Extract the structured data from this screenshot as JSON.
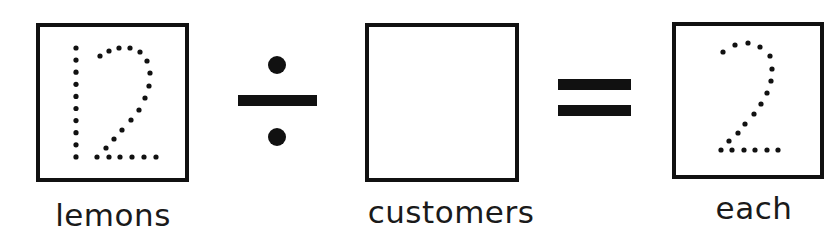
{
  "equation": {
    "dividend": {
      "value": "12",
      "style": "dotted-tracing",
      "label": "lemons"
    },
    "operator_1": {
      "symbol": "÷",
      "name": "divide"
    },
    "divisor": {
      "value": "",
      "style": "empty-box",
      "label": "customers"
    },
    "operator_2": {
      "symbol": "=",
      "name": "equals"
    },
    "quotient": {
      "value": "2",
      "style": "dotted-tracing",
      "label": "each"
    }
  },
  "colors": {
    "ink": "#111111",
    "background": "#ffffff"
  }
}
